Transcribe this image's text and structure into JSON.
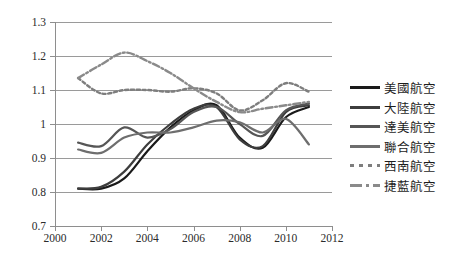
{
  "chart_data": {
    "type": "line",
    "title": "",
    "xlabel": "",
    "ylabel": "",
    "xlim": [
      2000,
      2012
    ],
    "ylim": [
      0.7,
      1.3
    ],
    "xticks": [
      "2000",
      "2002",
      "2004",
      "2006",
      "2008",
      "2010",
      "2012"
    ],
    "yticks": [
      "1.3",
      "1.2",
      "1.1",
      "1",
      "0.9",
      "0.8",
      "0.7"
    ],
    "grid": true,
    "legend_position": "right",
    "x": [
      2001,
      2002,
      2003,
      2004,
      2005,
      2006,
      2007,
      2008,
      2009,
      2010,
      2011
    ],
    "series": [
      {
        "name": "美國航空",
        "style": "solid",
        "color": "#1a1a1a",
        "values": [
          0.81,
          0.81,
          0.84,
          0.92,
          0.99,
          1.04,
          1.055,
          0.96,
          0.93,
          1.02,
          1.05
        ]
      },
      {
        "name": "大陸航空",
        "style": "solid",
        "color": "#3d3d3d",
        "values": [
          0.81,
          0.815,
          0.86,
          0.94,
          1.0,
          1.045,
          1.05,
          0.955,
          0.935,
          1.035,
          1.055
        ]
      },
      {
        "name": "達美航空",
        "style": "solid",
        "color": "#565656",
        "values": [
          0.945,
          0.935,
          0.99,
          0.96,
          0.985,
          1.035,
          1.05,
          1.0,
          0.965,
          1.04,
          1.06
        ]
      },
      {
        "name": "聯合航空",
        "style": "solid",
        "color": "#6e6e6e",
        "values": [
          0.925,
          0.915,
          0.96,
          0.975,
          0.975,
          0.99,
          1.01,
          1.005,
          0.975,
          1.015,
          0.94
        ]
      },
      {
        "name": "西南航空",
        "style": "dotted",
        "color": "#7e7e7e",
        "values": [
          1.135,
          1.09,
          1.1,
          1.1,
          1.095,
          1.105,
          1.09,
          1.04,
          1.07,
          1.12,
          1.095
        ]
      },
      {
        "name": "捷藍航空",
        "style": "dashdot",
        "color": "#8a8a8a",
        "values": [
          1.135,
          1.175,
          1.21,
          1.185,
          1.15,
          1.105,
          1.065,
          1.035,
          1.045,
          1.055,
          1.065
        ]
      }
    ],
    "legend_entries": [
      "美國航空",
      "大陸航空",
      "達美航空",
      "聯合航空",
      "西南航空",
      "捷藍航空"
    ]
  }
}
